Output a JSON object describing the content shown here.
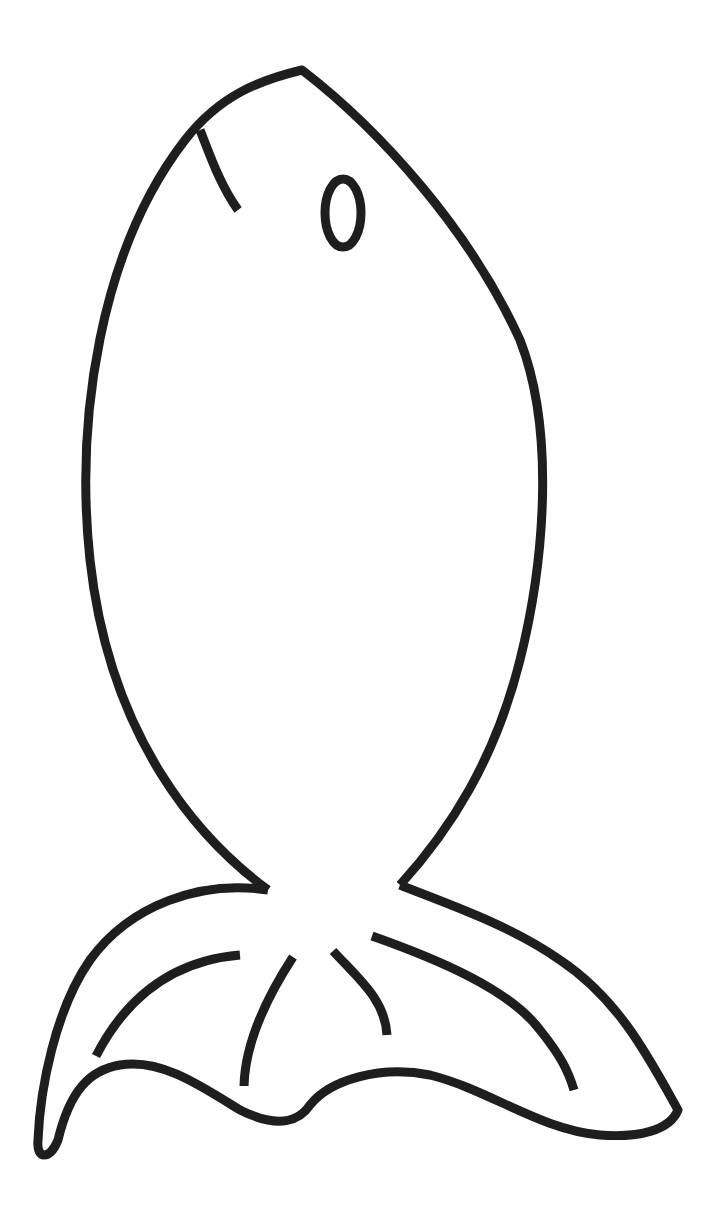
{
  "image": {
    "subject": "fish coloring page outline",
    "background_color": "#ffffff",
    "line_color": "#1e1e1e"
  },
  "parts": {
    "body": "fish-body-outline",
    "mouth": "mouth-line",
    "eye": "eye-oval",
    "tail": "tail-fin-outline",
    "tail_stripes": [
      "tail-stripe-1",
      "tail-stripe-2",
      "tail-stripe-3",
      "tail-stripe-4",
      "tail-stripe-5"
    ]
  }
}
